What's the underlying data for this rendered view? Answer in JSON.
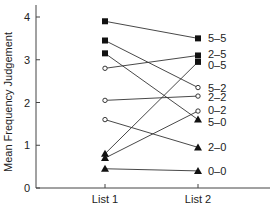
{
  "chart_data": {
    "type": "line",
    "title": "",
    "xlabel": "",
    "ylabel": "Mean Frequency Judgement",
    "categories": [
      "List 1",
      "List 2"
    ],
    "ylim": [
      0,
      4.2
    ],
    "yticks": [
      "0",
      "1",
      "2",
      "3",
      "4"
    ],
    "grid": false,
    "legend": "direct labels at right of List 2",
    "series": [
      {
        "name": "5-5",
        "marker": "square",
        "values": [
          3.9,
          3.5
        ]
      },
      {
        "name": "5-2",
        "marker": "square",
        "values": [
          3.45,
          2.35
        ]
      },
      {
        "name": "5-0",
        "marker": "square",
        "values": [
          3.15,
          1.6
        ]
      },
      {
        "name": "2-5",
        "marker": "circle",
        "values": [
          2.8,
          3.1
        ]
      },
      {
        "name": "2-2",
        "marker": "circle",
        "values": [
          2.05,
          2.15
        ]
      },
      {
        "name": "2-0",
        "marker": "circle",
        "values": [
          1.6,
          0.95
        ]
      },
      {
        "name": "0-5",
        "marker": "triangle",
        "values": [
          0.8,
          2.95
        ]
      },
      {
        "name": "0-2",
        "marker": "triangle",
        "values": [
          0.7,
          1.8
        ]
      },
      {
        "name": "0-0",
        "marker": "triangle",
        "values": [
          0.45,
          0.4
        ]
      }
    ],
    "list2_markers": {
      "5-5": "square",
      "2-5": "square",
      "0-5": "square",
      "5-2": "circle",
      "2-2": "circle",
      "0-2": "circle",
      "5-0": "triangle",
      "2-0": "triangle",
      "0-0": "triangle"
    }
  }
}
